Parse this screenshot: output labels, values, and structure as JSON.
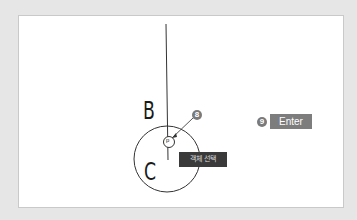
{
  "diagram": {
    "labels": {
      "b": "B",
      "c": "C",
      "p": "p"
    },
    "tooltip": "객체 선택",
    "steps": [
      {
        "number": "8"
      },
      {
        "number": "9",
        "key": "Enter"
      }
    ],
    "colors": {
      "background": "#e6e6e6",
      "panel": "#ffffff",
      "line": "#333333",
      "badge": "#7a7a7a",
      "key_box": "#7d7d7d",
      "tooltip": "#3a3a3a"
    }
  }
}
